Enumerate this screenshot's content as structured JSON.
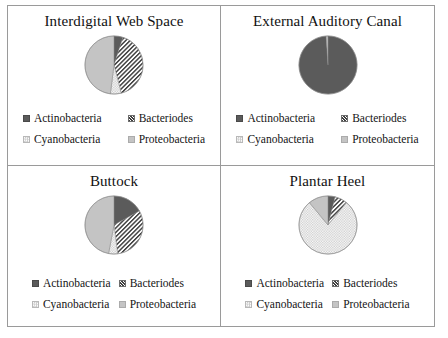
{
  "figure": {
    "panels": [
      {
        "id": "interdigital-web-space",
        "title": "Interdigital Web Space",
        "legend_layout": "wide",
        "legend": [
          {
            "key": "actinobacteria",
            "label": "Actinobacteria"
          },
          {
            "key": "bacteriodes",
            "label": "Bacteriodes"
          },
          {
            "key": "cyanobacteria",
            "label": "Cyanobacteria"
          },
          {
            "key": "proteobacteria",
            "label": "Proteobacteria"
          }
        ]
      },
      {
        "id": "external-auditory-canal",
        "title": "External Auditory Canal",
        "legend_layout": "wide",
        "legend": [
          {
            "key": "actinobacteria",
            "label": "Actinobacteria"
          },
          {
            "key": "bacteriodes",
            "label": "Bacteriodes"
          },
          {
            "key": "cyanobacteria",
            "label": "Cyanobacteria"
          },
          {
            "key": "proteobacteria",
            "label": "Proteobacteria"
          }
        ]
      },
      {
        "id": "buttock",
        "title": "Buttock",
        "legend_layout": "tight",
        "legend": [
          {
            "key": "actinobacteria",
            "label": "Actinobacteria"
          },
          {
            "key": "bacteriodes",
            "label": "Bacteriodes"
          },
          {
            "key": "cyanobacteria",
            "label": "Cyanobacteria"
          },
          {
            "key": "proteobacteria",
            "label": "Proteobacteria"
          }
        ]
      },
      {
        "id": "plantar-heel",
        "title": "Plantar Heel",
        "legend_layout": "tight",
        "legend": [
          {
            "key": "actinobacteria",
            "label": "Actinobacteria"
          },
          {
            "key": "bacteriodes",
            "label": "Bacteriodes"
          },
          {
            "key": "cyanobacteria",
            "label": "Cyanobacteria"
          },
          {
            "key": "proteobacteria",
            "label": "Proteobacteria"
          }
        ]
      }
    ]
  },
  "colors": {
    "actinobacteria": "#5b5b5b",
    "bacteriodes": "#3f3f3f",
    "cyanobacteria": "#c9c9c9",
    "proteobacteria": "#c4c4c4",
    "frame": "#9a9a9a",
    "text": "#141414",
    "background": "#ffffff"
  },
  "chart_data": [
    {
      "type": "pie",
      "title": "Interdigital Web Space",
      "categories": [
        "Actinobacteria",
        "Bacteriodes",
        "Cyanobacteria",
        "Proteobacteria"
      ],
      "values": [
        5,
        41,
        6,
        48
      ],
      "units": "percent",
      "legend_position": "bottom",
      "start_angle_deg": 0,
      "direction": "clockwise"
    },
    {
      "type": "pie",
      "title": "External Auditory Canal",
      "categories": [
        "Actinobacteria",
        "Bacteriodes",
        "Cyanobacteria",
        "Proteobacteria"
      ],
      "values": [
        99,
        0,
        0,
        1
      ],
      "units": "percent",
      "legend_position": "bottom",
      "start_angle_deg": 0,
      "direction": "clockwise"
    },
    {
      "type": "pie",
      "title": "Buttock",
      "categories": [
        "Actinobacteria",
        "Bacteriodes",
        "Cyanobacteria",
        "Proteobacteria"
      ],
      "values": [
        17,
        31,
        5,
        47
      ],
      "units": "percent",
      "legend_position": "bottom",
      "start_angle_deg": 0,
      "direction": "clockwise"
    },
    {
      "type": "pie",
      "title": "Plantar Heel",
      "categories": [
        "Actinobacteria",
        "Bacteriodes",
        "Cyanobacteria",
        "Proteobacteria"
      ],
      "values": [
        4,
        7,
        78,
        11
      ],
      "units": "percent",
      "legend_position": "bottom",
      "start_angle_deg": 0,
      "direction": "clockwise"
    }
  ]
}
